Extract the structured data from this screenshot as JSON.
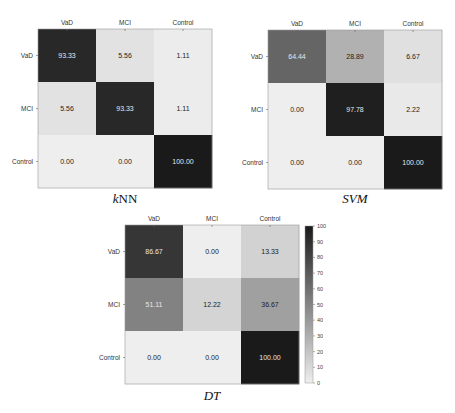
{
  "chart_data": [
    {
      "type": "heatmap",
      "title": "kNN",
      "title_parts": [
        {
          "text": "k",
          "italic": true
        },
        {
          "text": "NN",
          "italic": false
        }
      ],
      "x_categories": [
        "VaD",
        "MCI",
        "Control"
      ],
      "y_categories": [
        "VaD",
        "MCI",
        "Control"
      ],
      "values": [
        [
          93.33,
          5.56,
          1.11
        ],
        [
          5.56,
          93.33,
          1.11
        ],
        [
          0.0,
          0.0,
          100.0
        ]
      ],
      "labels": [
        [
          "93.33",
          "5.56",
          "1.11"
        ],
        [
          "5.56",
          "93.33",
          "1.11"
        ],
        [
          "0.00",
          "0.00",
          "100.00"
        ]
      ],
      "vmin": 0,
      "vmax": 100,
      "colormap": "gray_r"
    },
    {
      "type": "heatmap",
      "title": "SVM",
      "title_parts": [
        {
          "text": "SVM",
          "italic": true
        }
      ],
      "x_categories": [
        "VaD",
        "MCI",
        "Control"
      ],
      "y_categories": [
        "VaD",
        "MCI",
        "Control"
      ],
      "values": [
        [
          64.44,
          28.89,
          6.67
        ],
        [
          0.0,
          97.78,
          2.22
        ],
        [
          0.0,
          0.0,
          100.0
        ]
      ],
      "labels": [
        [
          "64.44",
          "28.89",
          "6.67"
        ],
        [
          "0.00",
          "97.78",
          "2.22"
        ],
        [
          "0.00",
          "0.00",
          "100.00"
        ]
      ],
      "vmin": 0,
      "vmax": 100,
      "colormap": "gray_r"
    },
    {
      "type": "heatmap",
      "title": "DT",
      "title_parts": [
        {
          "text": "DT",
          "italic": true
        }
      ],
      "x_categories": [
        "VaD",
        "MCI",
        "Control"
      ],
      "y_categories": [
        "VaD",
        "MCI",
        "Control"
      ],
      "values": [
        [
          86.67,
          0.0,
          13.33
        ],
        [
          51.11,
          12.22,
          36.67
        ],
        [
          0.0,
          0.0,
          100.0
        ]
      ],
      "labels": [
        [
          "86.67",
          "0.00",
          "13.33"
        ],
        [
          "51.11",
          "12.22",
          "36.67"
        ],
        [
          "0.00",
          "0.00",
          "100.00"
        ]
      ],
      "vmin": 0,
      "vmax": 100,
      "colormap": "gray_r",
      "colorbar": {
        "ticks": [
          0,
          10,
          20,
          30,
          40,
          50,
          60,
          70,
          80,
          90,
          100
        ],
        "placement": "right"
      }
    }
  ]
}
